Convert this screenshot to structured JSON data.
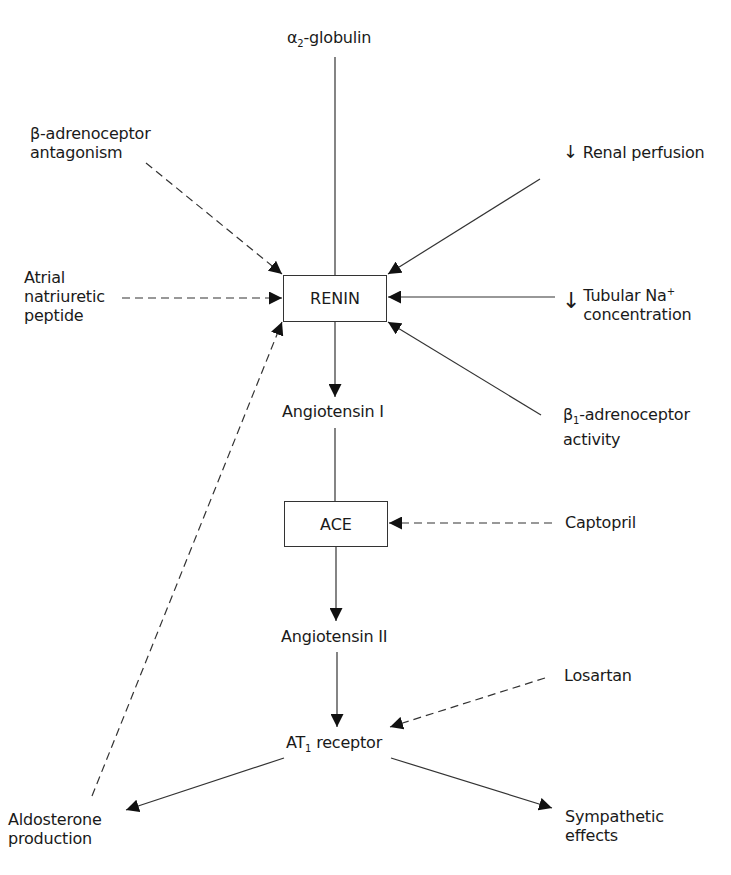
{
  "nodes": {
    "alpha2_globulin": {
      "symbol": "α",
      "sub": "2",
      "text": "-globulin"
    },
    "beta_antagonism": {
      "line1": "β-adrenoceptor",
      "line2": "antagonism"
    },
    "anp": {
      "line1": "Atrial",
      "line2": "natriuretic",
      "line3": "peptide"
    },
    "renal_perfusion": {
      "arrow": "↓",
      "text": "Renal perfusion"
    },
    "tubular_na": {
      "arrow": "↓",
      "line1": "Tubular Na",
      "sup": "+",
      "line2": "concentration"
    },
    "beta1_activity": {
      "symbol": "β",
      "sub": "1",
      "line1": "-adrenoceptor",
      "line2": "activity"
    },
    "renin": {
      "text": "RENIN"
    },
    "angiotensin_1": {
      "text": "Angiotensin I"
    },
    "ace": {
      "text": "ACE"
    },
    "captopril": {
      "text": "Captopril"
    },
    "angiotensin_2": {
      "text": "Angiotensin II"
    },
    "losartan": {
      "text": "Losartan"
    },
    "at1_receptor": {
      "prefix": "AT",
      "sub": "1",
      "text": " receptor"
    },
    "aldosterone": {
      "line1": "Aldosterone",
      "line2": "production"
    },
    "sympathetic": {
      "line1": "Sympathetic",
      "line2": "effects"
    }
  },
  "edges": [
    {
      "from": "alpha2_globulin",
      "to": "renin",
      "style": "solid",
      "arrow": false
    },
    {
      "from": "beta_antagonism",
      "to": "renin",
      "style": "dashed",
      "arrow": true
    },
    {
      "from": "anp",
      "to": "renin",
      "style": "dashed",
      "arrow": true
    },
    {
      "from": "aldosterone",
      "to": "renin",
      "style": "dashed",
      "arrow": true
    },
    {
      "from": "renal_perfusion",
      "to": "renin",
      "style": "solid",
      "arrow": true
    },
    {
      "from": "tubular_na",
      "to": "renin",
      "style": "solid",
      "arrow": true
    },
    {
      "from": "beta1_activity",
      "to": "renin",
      "style": "solid",
      "arrow": true
    },
    {
      "from": "renin",
      "to": "angiotensin_1",
      "style": "solid",
      "arrow": true
    },
    {
      "from": "angiotensin_1",
      "to": "ace",
      "style": "solid",
      "arrow": false
    },
    {
      "from": "captopril",
      "to": "ace",
      "style": "dashed",
      "arrow": true
    },
    {
      "from": "ace",
      "to": "angiotensin_2",
      "style": "solid",
      "arrow": true
    },
    {
      "from": "angiotensin_2",
      "to": "at1_receptor",
      "style": "solid",
      "arrow": true
    },
    {
      "from": "losartan",
      "to": "at1_receptor",
      "style": "dashed",
      "arrow": true
    },
    {
      "from": "at1_receptor",
      "to": "aldosterone",
      "style": "solid",
      "arrow": true
    },
    {
      "from": "at1_receptor",
      "to": "sympathetic",
      "style": "solid",
      "arrow": true
    }
  ],
  "colors": {
    "line": "#333333",
    "text": "#1a1a1a",
    "background": "#ffffff"
  }
}
